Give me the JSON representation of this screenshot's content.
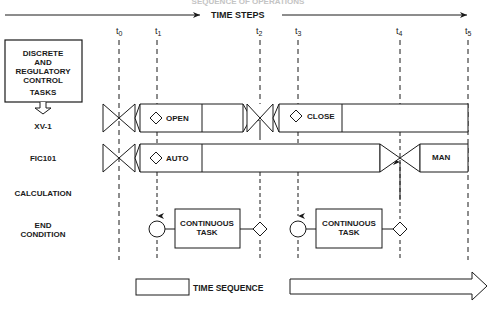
{
  "header": {
    "faint_title": "SEQUENCE OF OPERATIONS",
    "time_steps_label": "TIME STEPS"
  },
  "time_markers": [
    {
      "label": "t",
      "sub": "0",
      "x": 119
    },
    {
      "label": "t",
      "sub": "1",
      "x": 157
    },
    {
      "label": "t",
      "sub": "2",
      "x": 260
    },
    {
      "label": "t",
      "sub": "3",
      "x": 298
    },
    {
      "label": "t",
      "sub": "4",
      "x": 400
    },
    {
      "label": "t",
      "sub": "5",
      "x": 468
    }
  ],
  "control_box": {
    "lines": [
      "DISCRETE",
      "AND",
      "REGULATORY",
      "CONTROL",
      "TASKS"
    ]
  },
  "rows": {
    "xv1": {
      "label": "XV-1",
      "state1": "OPEN",
      "state2": "CLOSE"
    },
    "fic101": {
      "label": "FIC101",
      "state1": "AUTO",
      "state2": "MAN"
    },
    "calculation": {
      "label": "CALCULATION"
    },
    "end_condition": {
      "label_line1": "END",
      "label_line2": "CONDITION"
    }
  },
  "tasks": [
    {
      "line1": "CONTINUOUS",
      "line2": "TASK"
    },
    {
      "line1": "CONTINUOUS",
      "line2": "TASK"
    }
  ],
  "legend": {
    "label": "TIME SEQUENCE"
  },
  "colors": {
    "ink": "#1a1a1a",
    "background": "#ffffff",
    "faint": "#bdbdbd"
  }
}
